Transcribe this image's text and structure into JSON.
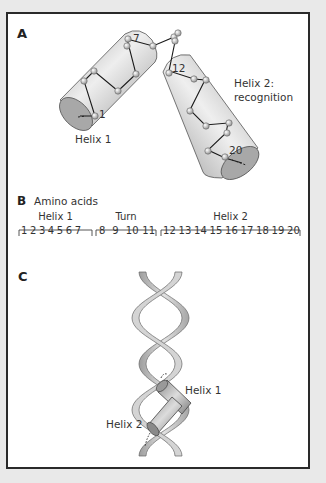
{
  "panelA": {
    "label": "A",
    "helix1_label": "Helix 1",
    "helix2_label_line1": "Helix 2:",
    "helix2_label_line2": "recognition",
    "residue_labels": {
      "start": "1",
      "helix1_end": "7",
      "helix2_start": "12",
      "end": "20"
    }
  },
  "panelB": {
    "label": "B",
    "title": "Amino acids",
    "groups": [
      {
        "name": "Helix 1",
        "residues": "1 2 3 4 5 6 7"
      },
      {
        "name": "Turn",
        "residues": "8  9  10 11"
      },
      {
        "name": "Helix 2",
        "residues": "12 13 14 15 16 17 18 19 20"
      }
    ]
  },
  "panelC": {
    "label": "C",
    "helix1_label": "Helix 1",
    "helix2_label": "Helix 2"
  },
  "colors": {
    "background": "#e9e9e9",
    "frame_border": "#2a2a2a",
    "cylinder_fill": "#cfcfcf",
    "dna_ribbon": "#c8c8c8"
  }
}
